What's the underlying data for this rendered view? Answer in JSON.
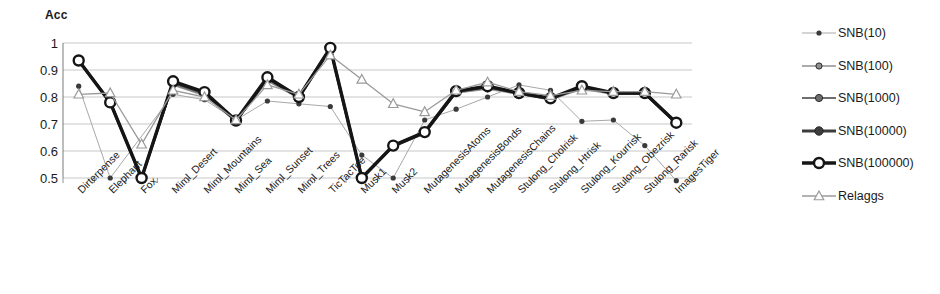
{
  "chart_data": {
    "type": "line",
    "title": "",
    "ylabel": "Acc",
    "xlabel": "",
    "ylim": [
      0.5,
      1
    ],
    "yticks": [
      "0.5",
      "0.6",
      "0.7",
      "0.8",
      "0.9",
      "1"
    ],
    "grid": true,
    "legend_position": "right",
    "categories": [
      "Dirterpense",
      "Elephant",
      "Fox",
      "Miml_Desert",
      "Miml_Mountains",
      "Miml_Sea",
      "Miml_Sunset",
      "Miml_Trees",
      "TicTacToe",
      "Musk1",
      "Musk2",
      "MutagenesisAtoms",
      "MutagenesisBonds",
      "MutagenesisChains",
      "Stulong_Cholrisk",
      "Stulong_Htrisk",
      "Stulong_Kourrisk",
      "Stulong_Obezrisk",
      "Stulong_Rarisk",
      "ImagesTiger"
    ],
    "series": [
      {
        "name": "SNB(10)",
        "color": "#a8a8a8",
        "marker": "dot",
        "marker_size": 2.6,
        "line_width": 1.0,
        "values": [
          0.84,
          0.5,
          null,
          0.81,
          0.79,
          0.715,
          0.785,
          0.775,
          0.765,
          0.585,
          0.5,
          0.715,
          0.755,
          0.8,
          0.845,
          0.825,
          0.71,
          0.715,
          0.62,
          0.49
        ]
      },
      {
        "name": "SNB(100)",
        "color": "#8f8f8f",
        "marker": "circle",
        "marker_size": 3.1,
        "line_width": 1.6,
        "values": [
          0.935,
          0.78,
          0.5,
          0.845,
          0.805,
          0.71,
          0.86,
          0.795,
          0.975,
          0.5,
          0.615,
          0.665,
          0.815,
          0.83,
          0.81,
          0.79,
          0.83,
          0.81,
          0.81,
          0.7
        ]
      },
      {
        "name": "SNB(1000)",
        "color": "#6e6e6e",
        "marker": "circle",
        "marker_size": 3.6,
        "line_width": 2.0,
        "values": [
          0.935,
          0.78,
          0.5,
          0.85,
          0.81,
          0.71,
          0.865,
          0.8,
          0.978,
          0.5,
          0.617,
          0.667,
          0.818,
          0.835,
          0.812,
          0.792,
          0.835,
          0.812,
          0.812,
          0.702
        ]
      },
      {
        "name": "SNB(10000)",
        "color": "#3d3d3d",
        "marker": "circle",
        "marker_size": 4.2,
        "line_width": 2.8,
        "values": [
          0.935,
          0.78,
          0.5,
          0.855,
          0.815,
          0.712,
          0.87,
          0.8,
          0.98,
          0.5,
          0.618,
          0.668,
          0.82,
          0.838,
          0.814,
          0.794,
          0.838,
          0.814,
          0.814,
          0.704
        ]
      },
      {
        "name": "SNB(100000)",
        "color": "#151515",
        "marker": "open-circle",
        "marker_size": 5.0,
        "line_width": 3.4,
        "values": [
          0.935,
          0.78,
          0.5,
          0.858,
          0.818,
          0.713,
          0.873,
          0.8,
          0.982,
          0.5,
          0.62,
          0.67,
          0.822,
          0.84,
          0.815,
          0.795,
          0.84,
          0.815,
          0.815,
          0.705
        ]
      },
      {
        "name": "Relaggs",
        "color": "#9a9a9a",
        "marker": "triangle",
        "marker_size": 5.0,
        "line_width": 1.3,
        "values": [
          0.81,
          0.815,
          0.625,
          0.825,
          0.8,
          0.715,
          0.845,
          0.81,
          0.955,
          0.865,
          0.775,
          0.745,
          0.825,
          0.855,
          0.82,
          0.805,
          0.825,
          0.82,
          0.82,
          0.81
        ]
      }
    ]
  },
  "legend": {
    "items": [
      {
        "label": "SNB(10)"
      },
      {
        "label": "SNB(100)"
      },
      {
        "label": "SNB(1000)"
      },
      {
        "label": "SNB(10000)"
      },
      {
        "label": "SNB(100000)"
      },
      {
        "label": "Relaggs"
      }
    ]
  }
}
